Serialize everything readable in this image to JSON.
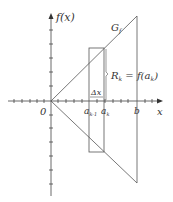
{
  "diagram": {
    "y_axis_label": "f(x)",
    "x_axis_label": "x",
    "origin_label": "0",
    "curve_label": "G",
    "curve_label_sub": "f",
    "dx_label": "Δx",
    "rect_height_label": "R",
    "rect_height_sub": "k",
    "rect_height_eq": " = f(a",
    "rect_height_eq_sub": "k",
    "rect_height_eq_close": ")",
    "tick_a_prev": "a",
    "tick_a_prev_sub": "k-1",
    "tick_a": "a",
    "tick_a_sub": "k",
    "tick_b": "b",
    "line_color": "#555555"
  }
}
